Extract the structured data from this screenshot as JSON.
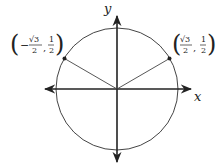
{
  "diagram": {
    "axes": {
      "x_label": "x",
      "y_label": "y"
    },
    "circle": {
      "center": [
        117,
        89
      ],
      "radius": 61,
      "stroke": "#444444"
    },
    "points": [
      {
        "name": "left-point",
        "coords_text": "(−√3/2, 1/2)",
        "sign": "−",
        "num_x": "√3",
        "den_x": "2",
        "num_y": "1",
        "den_y": "2",
        "angle_deg": 150
      },
      {
        "name": "right-point",
        "coords_text": "(√3/2, 1/2)",
        "sign": "",
        "num_x": "√3",
        "den_x": "2",
        "num_y": "1",
        "den_y": "2",
        "angle_deg": 30
      }
    ],
    "colors": {
      "axis": "#222222",
      "circle": "#444444",
      "radius_line": "#444444",
      "point": "#222222"
    }
  }
}
